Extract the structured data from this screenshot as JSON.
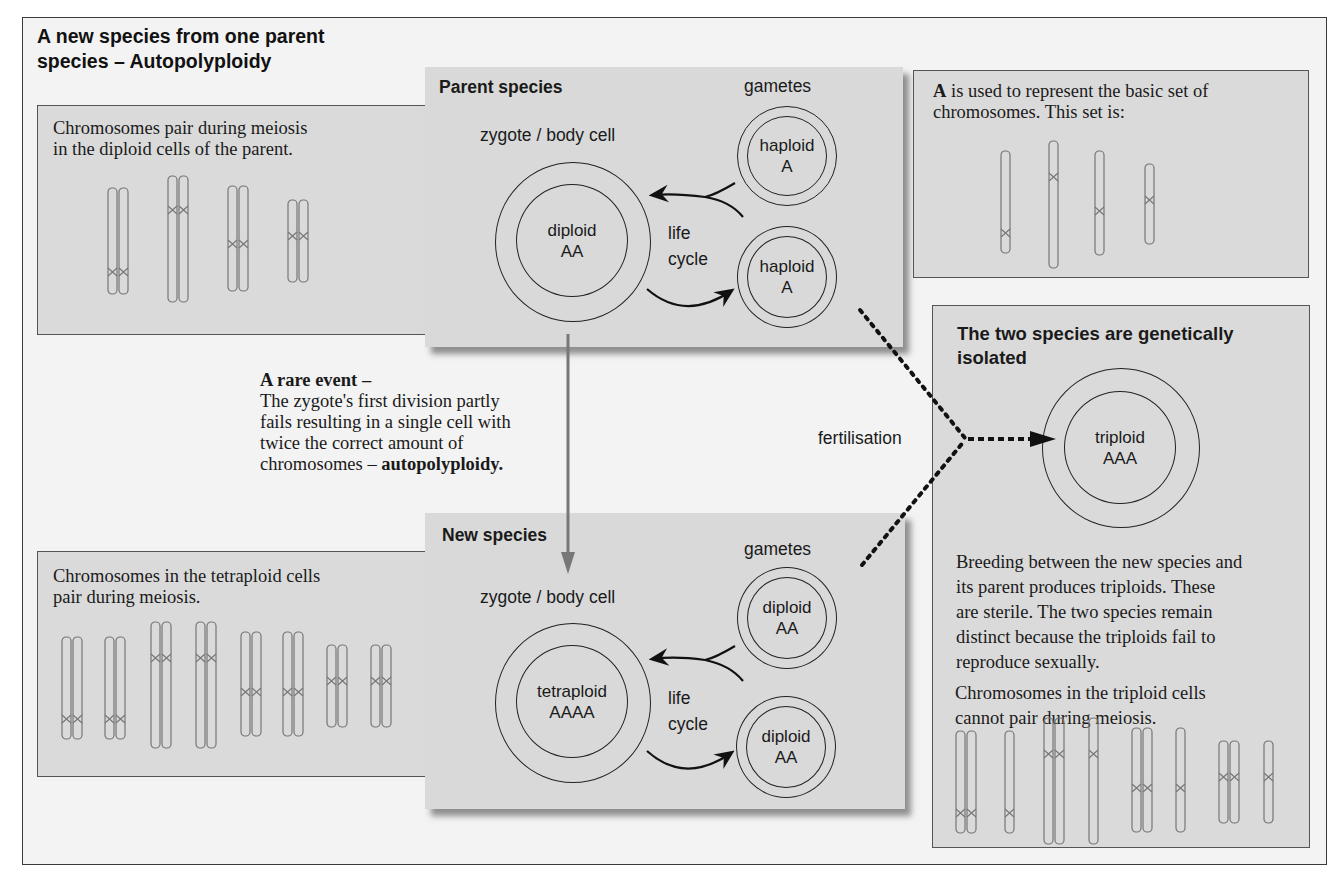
{
  "title": {
    "line1": "A new species from one parent",
    "line2": "species – Autopolyploidy"
  },
  "top_left_panel": {
    "text": "Chromosomes pair during meiosis in the diploid cells of the parent.",
    "line1": "Chromosomes pair during meiosis",
    "line2": "in the diploid cells of the parent.",
    "chromosome_pairs": 4
  },
  "parent_species": {
    "heading": "Parent species",
    "gametes_label": "gametes",
    "zygote_label": "zygote / body cell",
    "zygote": {
      "line1": "diploid",
      "line2": "AA"
    },
    "cycle_label": {
      "line1": "life",
      "line2": "cycle"
    },
    "gamete_top": {
      "line1": "haploid",
      "line2": "A"
    },
    "gamete_bottom": {
      "line1": "haploid",
      "line2": "A"
    }
  },
  "basic_set_panel": {
    "bold": "A",
    "line1_rest": " is used to represent the basic set of",
    "line2": "chromosomes. This set is:",
    "chromosomes": 4
  },
  "rare_event": {
    "heading": "A rare event –",
    "line1": "The zygote's first division partly",
    "line2": "fails resulting in a single cell with",
    "line3": "twice the correct amount of",
    "line4_prefix": "chromosomes – ",
    "line4_bold": "autopolyploidy."
  },
  "new_species": {
    "heading": "New species",
    "gametes_label": "gametes",
    "zygote_label": "zygote / body cell",
    "zygote": {
      "line1": "tetraploid",
      "line2": "AAAA"
    },
    "cycle_label": {
      "line1": "life",
      "line2": "cycle"
    },
    "gamete_top": {
      "line1": "diploid",
      "line2": "AA"
    },
    "gamete_bottom": {
      "line1": "diploid",
      "line2": "AA"
    }
  },
  "bottom_left_panel": {
    "line1": "Chromosomes in the tetraploid cells",
    "line2": "pair during meiosis.",
    "chromosome_groups": 8
  },
  "fertilisation_label": "fertilisation",
  "isolation_panel": {
    "heading_line1": "The two species are genetically",
    "heading_line2": "isolated",
    "offspring": {
      "line1": "triploid",
      "line2": "AAA"
    },
    "para1": [
      "Breeding between the new species and",
      "its parent produces triploids. These",
      "are sterile. The two species remain",
      "distinct because the  triploids fail to",
      "reproduce sexually."
    ],
    "para2": [
      "Chromosomes in the triploid  cells",
      "cannot pair during meiosis."
    ],
    "chromosome_groups": 8
  },
  "colors": {
    "panel_fill": "#dadada",
    "frame_fill": "#f3f3f3",
    "chromosome_stroke": "#777777",
    "arrow_gray": "#777777",
    "text": "#1a1a1a"
  }
}
